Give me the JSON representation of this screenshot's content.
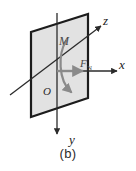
{
  "figure": {
    "caption": "(b)",
    "type": "3d-coordinate-force-moment-diagram",
    "background_color": "#ffffff"
  },
  "axes": [
    {
      "id": "z",
      "label": "z",
      "direction": "up-right",
      "label_x": 104,
      "label_y": 24
    },
    {
      "id": "x",
      "label": "x",
      "direction": "right",
      "label_x": 120,
      "label_y": 68
    },
    {
      "id": "y",
      "label": "y",
      "direction": "down",
      "label_x": 70,
      "label_y": 142
    }
  ],
  "origin": {
    "label": "O",
    "label_x": 44,
    "label_y": 94,
    "x": 57,
    "y": 71
  },
  "vectors": [
    {
      "id": "moment",
      "label": "M",
      "style": "curved-arrow",
      "color": "#8a8a8a",
      "label_x": 62,
      "label_y": 44
    },
    {
      "id": "normal-force",
      "label": "F",
      "subscript": "N",
      "style": "straight-arrow",
      "color": "#8a8a8a",
      "label_x": 82,
      "label_y": 68
    }
  ],
  "plane": {
    "id": "vertical-plane",
    "fill_color": "#e2e2e2",
    "stroke_color": "#1c1c1c",
    "points": "31,32 88,14 88,98 31,117"
  },
  "colors": {
    "plane_fill": "#e2e2e2",
    "plane_stroke": "#1c1c1c",
    "axis_line": "#2b2b2b",
    "vector_gray": "#8a8a8a",
    "text": "#1a1a1a"
  }
}
